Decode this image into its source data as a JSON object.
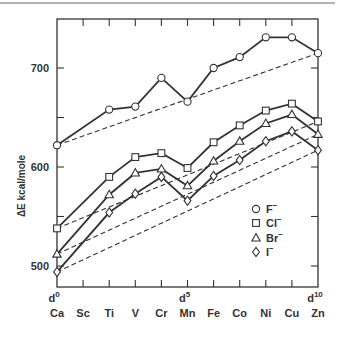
{
  "chart_data": {
    "type": "line",
    "title": "",
    "xlabel": "",
    "ylabel": "ΔE kcal/mole",
    "categories": [
      "Ca",
      "Sc",
      "Ti",
      "V",
      "Cr",
      "Mn",
      "Fe",
      "Co",
      "Ni",
      "Cu",
      "Zn"
    ],
    "d_labels": [
      {
        "index": 0,
        "base": "d",
        "sup": "0"
      },
      {
        "index": 5,
        "base": "d",
        "sup": "5"
      },
      {
        "index": 10,
        "base": "d",
        "sup": "10"
      }
    ],
    "ylim": [
      480,
      750
    ],
    "yticks": [
      500,
      550,
      600,
      650,
      700
    ],
    "ytick_labels": [
      {
        "value": 500,
        "label": "500"
      },
      {
        "value": 600,
        "label": "600"
      },
      {
        "value": 700,
        "label": "700"
      }
    ],
    "grid": false,
    "legend_position": "lower right inside",
    "series": [
      {
        "name": "F⁻",
        "marker": "circle",
        "values": [
          622,
          null,
          658,
          661,
          690,
          666,
          700,
          711,
          731,
          731,
          715
        ]
      },
      {
        "name": "Cl⁻",
        "marker": "square",
        "values": [
          538,
          null,
          590,
          610,
          614,
          599,
          625,
          642,
          657,
          664,
          646
        ]
      },
      {
        "name": "Br⁻",
        "marker": "triangle",
        "values": [
          512,
          null,
          572,
          594,
          598,
          581,
          606,
          626,
          644,
          653,
          633
        ]
      },
      {
        "name": "I⁻",
        "marker": "diamond",
        "values": [
          494,
          null,
          554,
          573,
          590,
          566,
          591,
          607,
          626,
          636,
          617
        ]
      }
    ],
    "baselines": {
      "style": "dashed",
      "description": "Straight dashed line from d0 (Ca) to d10 (Zn) for each series"
    }
  },
  "legend": {
    "items": [
      {
        "marker": "circle",
        "label": "F",
        "sup": "−"
      },
      {
        "marker": "square",
        "label": "Cl",
        "sup": "−"
      },
      {
        "marker": "triangle",
        "label": "Br",
        "sup": "−"
      },
      {
        "marker": "diamond",
        "label": "I",
        "sup": "−"
      }
    ]
  }
}
